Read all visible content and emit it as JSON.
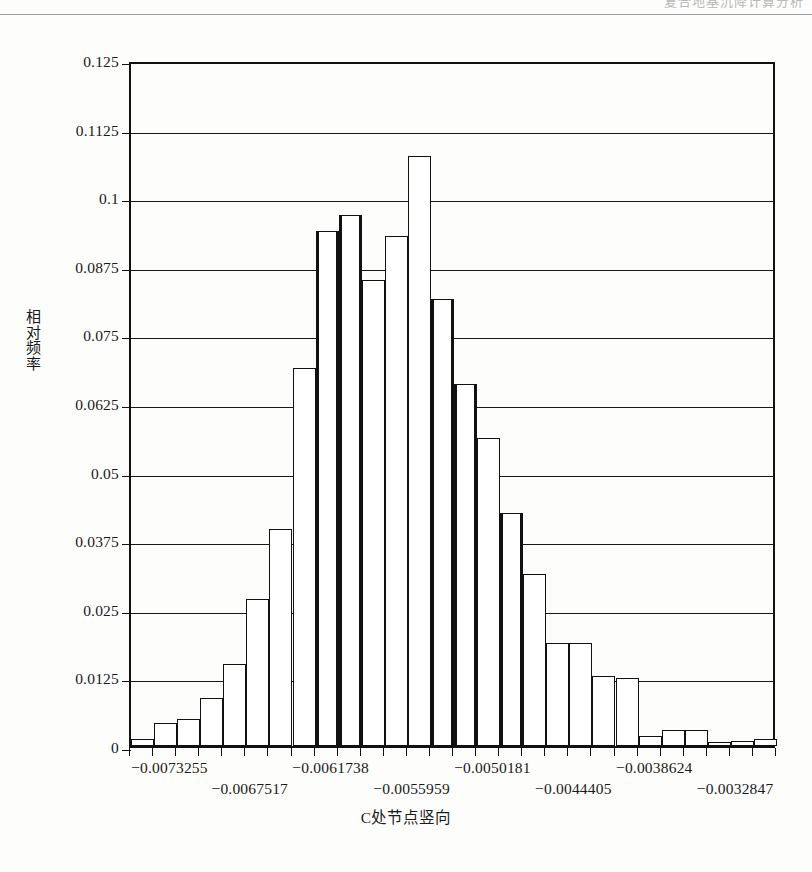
{
  "page": {
    "header_ghost_text": "复合地基沉降计算分析",
    "speckle": ""
  },
  "chart_data": {
    "type": "bar",
    "title": "",
    "subtitle": "",
    "xlabel": "C处节点竖向",
    "ylabel": "相对频率",
    "ylabel_chars": [
      "相",
      "对",
      "频",
      "率"
    ],
    "xlim": [
      -0.0076144,
      -0.003
    ],
    "ylim": [
      0,
      0.125
    ],
    "grid": true,
    "legend": null,
    "y_ticks": [
      0,
      0.0125,
      0.025,
      0.0375,
      0.05,
      0.0625,
      0.075,
      0.0875,
      0.1,
      0.1125,
      0.125
    ],
    "y_tick_labels": [
      "0",
      "0.0125",
      "0.025",
      "0.0375",
      "0.05",
      "0.0625",
      "0.075",
      "0.0875",
      "0.1",
      "0.1125",
      "0.125"
    ],
    "x_tick_labels": [
      {
        "text": "−0.0073255",
        "value": -0.0073255,
        "row": 0
      },
      {
        "text": "−0.0067517",
        "value": -0.0067517,
        "row": 1
      },
      {
        "text": "−0.0061738",
        "value": -0.0061738,
        "row": 0
      },
      {
        "text": "−0.0055959",
        "value": -0.0055959,
        "row": 1
      },
      {
        "text": "−0.0050181",
        "value": -0.0050181,
        "row": 0
      },
      {
        "text": "−0.0044405",
        "value": -0.0044405,
        "row": 1
      },
      {
        "text": "−0.0038624",
        "value": -0.0038624,
        "row": 0
      },
      {
        "text": "−0.0032847",
        "value": -0.0032847,
        "row": 1
      }
    ],
    "n_bins": 28,
    "bin_centers": [
      -0.00755,
      -0.0073755,
      -0.007201,
      -0.0070265,
      -0.006852,
      -0.0066775,
      -0.006503,
      -0.0063285,
      -0.006154,
      -0.0059795,
      -0.005805,
      -0.0056305,
      -0.005456,
      -0.0052815,
      -0.005107,
      -0.0049325,
      -0.004758,
      -0.0045835,
      -0.004409,
      -0.0042345,
      -0.00406,
      -0.0038855,
      -0.003711,
      -0.0035365,
      -0.003362,
      -0.0031875,
      -0.003013,
      -0.0028385
    ],
    "categories": [
      "bin1",
      "bin2",
      "bin3",
      "bin4",
      "bin5",
      "bin6",
      "bin7",
      "bin8",
      "bin9",
      "bin10",
      "bin11",
      "bin12",
      "bin13",
      "bin14",
      "bin15",
      "bin16",
      "bin17",
      "bin18",
      "bin19",
      "bin20",
      "bin21",
      "bin22",
      "bin23",
      "bin24",
      "bin25",
      "bin26",
      "bin27",
      "bin28"
    ],
    "values": [
      0.0012,
      0.0042,
      0.005,
      0.0088,
      0.015,
      0.0268,
      0.0395,
      0.0688,
      0.0938,
      0.0968,
      0.085,
      0.093,
      0.1075,
      0.0815,
      0.066,
      0.0562,
      0.0425,
      0.0313,
      0.0188,
      0.0188,
      0.0128,
      0.0124,
      0.0018,
      0.003,
      0.003,
      0.0008,
      0.001,
      0.0012
    ],
    "heavy_edge_bins": [
      8,
      9,
      13,
      14,
      16
    ],
    "bar_fill": "#ffffff",
    "bar_edge": "#111111",
    "axis_color": "#111111",
    "grid_color": "#161616",
    "background": "#fdfdfb"
  }
}
